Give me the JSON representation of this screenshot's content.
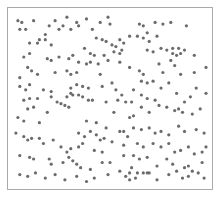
{
  "chart_data": {
    "type": "scatter",
    "title": "",
    "xlabel": "",
    "ylabel": "",
    "xlim": [
      0,
      1
    ],
    "ylim": [
      0,
      1
    ],
    "grid": false,
    "legend": null,
    "marker_color": "#6b6b6b",
    "frame_color": "#aaaaaa",
    "points": [
      [
        0.03,
        0.95
      ],
      [
        0.05,
        0.94
      ],
      [
        0.04,
        0.9
      ],
      [
        0.07,
        0.9
      ],
      [
        0.11,
        0.95
      ],
      [
        0.17,
        0.87
      ],
      [
        0.19,
        0.92
      ],
      [
        0.22,
        0.95
      ],
      [
        0.24,
        0.9
      ],
      [
        0.26,
        0.92
      ],
      [
        0.28,
        0.97
      ],
      [
        0.3,
        0.9
      ],
      [
        0.33,
        0.94
      ],
      [
        0.09,
        0.82
      ],
      [
        0.13,
        0.82
      ],
      [
        0.14,
        0.84
      ],
      [
        0.17,
        0.84
      ],
      [
        0.2,
        0.81
      ],
      [
        0.06,
        0.74
      ],
      [
        0.09,
        0.76
      ],
      [
        0.18,
        0.73
      ],
      [
        0.2,
        0.72
      ],
      [
        0.24,
        0.74
      ],
      [
        0.29,
        0.73
      ],
      [
        0.31,
        0.75
      ],
      [
        0.08,
        0.68
      ],
      [
        0.1,
        0.66
      ],
      [
        0.13,
        0.64
      ],
      [
        0.04,
        0.62
      ],
      [
        0.28,
        0.66
      ],
      [
        0.3,
        0.64
      ],
      [
        0.22,
        0.65
      ],
      [
        0.34,
        0.92
      ],
      [
        0.38,
        0.96
      ],
      [
        0.41,
        0.9
      ],
      [
        0.45,
        0.94
      ],
      [
        0.49,
        0.97
      ],
      [
        0.5,
        0.93
      ],
      [
        0.43,
        0.85
      ],
      [
        0.46,
        0.84
      ],
      [
        0.48,
        0.83
      ],
      [
        0.51,
        0.81
      ],
      [
        0.53,
        0.8
      ],
      [
        0.55,
        0.84
      ],
      [
        0.57,
        0.82
      ],
      [
        0.6,
        0.86
      ],
      [
        0.37,
        0.79
      ],
      [
        0.4,
        0.76
      ],
      [
        0.42,
        0.75
      ],
      [
        0.47,
        0.75
      ],
      [
        0.52,
        0.77
      ],
      [
        0.55,
        0.76
      ],
      [
        0.56,
        0.78
      ],
      [
        0.34,
        0.71
      ],
      [
        0.38,
        0.7
      ],
      [
        0.4,
        0.71
      ],
      [
        0.44,
        0.7
      ],
      [
        0.49,
        0.72
      ],
      [
        0.55,
        0.71
      ],
      [
        0.33,
        0.65
      ],
      [
        0.45,
        0.64
      ],
      [
        0.6,
        0.68
      ],
      [
        0.65,
        0.93
      ],
      [
        0.67,
        0.92
      ],
      [
        0.69,
        0.88
      ],
      [
        0.73,
        0.94
      ],
      [
        0.77,
        0.93
      ],
      [
        0.81,
        0.94
      ],
      [
        0.89,
        0.92
      ],
      [
        0.64,
        0.86
      ],
      [
        0.67,
        0.85
      ],
      [
        0.7,
        0.83
      ],
      [
        0.74,
        0.86
      ],
      [
        0.69,
        0.78
      ],
      [
        0.72,
        0.77
      ],
      [
        0.76,
        0.79
      ],
      [
        0.79,
        0.78
      ],
      [
        0.82,
        0.79
      ],
      [
        0.85,
        0.79
      ],
      [
        0.88,
        0.78
      ],
      [
        0.82,
        0.76
      ],
      [
        0.84,
        0.75
      ],
      [
        0.86,
        0.76
      ],
      [
        0.93,
        0.75
      ],
      [
        0.75,
        0.7
      ],
      [
        0.81,
        0.72
      ],
      [
        0.83,
        0.69
      ],
      [
        0.65,
        0.66
      ],
      [
        0.67,
        0.64
      ],
      [
        0.77,
        0.65
      ],
      [
        0.86,
        0.64
      ],
      [
        0.93,
        0.65
      ],
      [
        0.99,
        0.68
      ],
      [
        0.04,
        0.57
      ],
      [
        0.07,
        0.55
      ],
      [
        0.09,
        0.58
      ],
      [
        0.16,
        0.55
      ],
      [
        0.2,
        0.54
      ],
      [
        0.3,
        0.56
      ],
      [
        0.3,
        0.53
      ],
      [
        0.33,
        0.58
      ],
      [
        0.06,
        0.49
      ],
      [
        0.09,
        0.5
      ],
      [
        0.13,
        0.5
      ],
      [
        0.2,
        0.51
      ],
      [
        0.23,
        0.48
      ],
      [
        0.25,
        0.47
      ],
      [
        0.28,
        0.51
      ],
      [
        0.31,
        0.52
      ],
      [
        0.34,
        0.52
      ],
      [
        0.08,
        0.44
      ],
      [
        0.11,
        0.45
      ],
      [
        0.03,
        0.39
      ],
      [
        0.06,
        0.37
      ],
      [
        0.14,
        0.36
      ],
      [
        0.18,
        0.42
      ],
      [
        0.27,
        0.46
      ],
      [
        0.29,
        0.45
      ],
      [
        0.36,
        0.57
      ],
      [
        0.39,
        0.56
      ],
      [
        0.46,
        0.57
      ],
      [
        0.51,
        0.59
      ],
      [
        0.53,
        0.55
      ],
      [
        0.56,
        0.52
      ],
      [
        0.62,
        0.55
      ],
      [
        0.66,
        0.52
      ],
      [
        0.36,
        0.51
      ],
      [
        0.39,
        0.49
      ],
      [
        0.41,
        0.49
      ],
      [
        0.48,
        0.48
      ],
      [
        0.54,
        0.49
      ],
      [
        0.58,
        0.48
      ],
      [
        0.61,
        0.48
      ],
      [
        0.52,
        0.42
      ],
      [
        0.6,
        0.39
      ],
      [
        0.62,
        0.4
      ],
      [
        0.48,
        0.33
      ],
      [
        0.38,
        0.37
      ],
      [
        0.43,
        0.36
      ],
      [
        0.66,
        0.6
      ],
      [
        0.69,
        0.59
      ],
      [
        0.72,
        0.6
      ],
      [
        0.76,
        0.56
      ],
      [
        0.8,
        0.59
      ],
      [
        0.84,
        0.53
      ],
      [
        0.88,
        0.48
      ],
      [
        0.91,
        0.51
      ],
      [
        0.94,
        0.56
      ],
      [
        0.69,
        0.5
      ],
      [
        0.73,
        0.49
      ],
      [
        0.75,
        0.46
      ],
      [
        0.66,
        0.45
      ],
      [
        0.7,
        0.42
      ],
      [
        0.79,
        0.45
      ],
      [
        0.83,
        0.43
      ],
      [
        0.85,
        0.44
      ],
      [
        0.87,
        0.42
      ],
      [
        0.92,
        0.41
      ],
      [
        0.96,
        0.44
      ],
      [
        0.99,
        0.53
      ],
      [
        0.02,
        0.3
      ],
      [
        0.06,
        0.28
      ],
      [
        0.08,
        0.26
      ],
      [
        0.1,
        0.27
      ],
      [
        0.14,
        0.27
      ],
      [
        0.16,
        0.24
      ],
      [
        0.21,
        0.26
      ],
      [
        0.25,
        0.22
      ],
      [
        0.28,
        0.19
      ],
      [
        0.3,
        0.21
      ],
      [
        0.04,
        0.17
      ],
      [
        0.09,
        0.16
      ],
      [
        0.11,
        0.15
      ],
      [
        0.19,
        0.15
      ],
      [
        0.2,
        0.12
      ],
      [
        0.26,
        0.13
      ],
      [
        0.29,
        0.16
      ],
      [
        0.31,
        0.14
      ],
      [
        0.33,
        0.12
      ],
      [
        0.34,
        0.3
      ],
      [
        0.37,
        0.28
      ],
      [
        0.4,
        0.31
      ],
      [
        0.43,
        0.29
      ],
      [
        0.45,
        0.26
      ],
      [
        0.47,
        0.27
      ],
      [
        0.34,
        0.22
      ],
      [
        0.36,
        0.24
      ],
      [
        0.42,
        0.2
      ],
      [
        0.46,
        0.19
      ],
      [
        0.35,
        0.1
      ],
      [
        0.4,
        0.09
      ],
      [
        0.46,
        0.13
      ],
      [
        0.5,
        0.13
      ],
      [
        0.55,
        0.31
      ],
      [
        0.57,
        0.31
      ],
      [
        0.59,
        0.28
      ],
      [
        0.62,
        0.33
      ],
      [
        0.66,
        0.32
      ],
      [
        0.51,
        0.25
      ],
      [
        0.57,
        0.23
      ],
      [
        0.64,
        0.24
      ],
      [
        0.67,
        0.22
      ],
      [
        0.57,
        0.17
      ],
      [
        0.62,
        0.17
      ],
      [
        0.65,
        0.15
      ],
      [
        0.61,
        0.1
      ],
      [
        0.7,
        0.33
      ],
      [
        0.73,
        0.3
      ],
      [
        0.76,
        0.31
      ],
      [
        0.8,
        0.29
      ],
      [
        0.85,
        0.34
      ],
      [
        0.88,
        0.31
      ],
      [
        0.94,
        0.32
      ],
      [
        0.98,
        0.3
      ],
      [
        0.72,
        0.24
      ],
      [
        0.76,
        0.22
      ],
      [
        0.8,
        0.24
      ],
      [
        0.83,
        0.19
      ],
      [
        0.86,
        0.2
      ],
      [
        0.9,
        0.22
      ],
      [
        0.69,
        0.16
      ],
      [
        0.74,
        0.11
      ],
      [
        0.79,
        0.15
      ],
      [
        0.82,
        0.12
      ],
      [
        0.88,
        0.1
      ],
      [
        0.93,
        0.18
      ],
      [
        0.97,
        0.19
      ],
      [
        0.04,
        0.06
      ],
      [
        0.08,
        0.05
      ],
      [
        0.12,
        0.07
      ],
      [
        0.17,
        0.04
      ],
      [
        0.22,
        0.06
      ],
      [
        0.27,
        0.03
      ],
      [
        0.33,
        0.05
      ],
      [
        0.38,
        0.02
      ],
      [
        0.42,
        0.04
      ],
      [
        0.49,
        0.06
      ],
      [
        0.55,
        0.08
      ],
      [
        0.58,
        0.05
      ],
      [
        0.63,
        0.04
      ],
      [
        0.7,
        0.07
      ],
      [
        0.74,
        0.03
      ],
      [
        0.8,
        0.06
      ],
      [
        0.84,
        0.08
      ],
      [
        0.87,
        0.04
      ],
      [
        0.9,
        0.05
      ],
      [
        0.95,
        0.07
      ],
      [
        0.98,
        0.04
      ],
      [
        0.6,
        0.07
      ],
      [
        0.6,
        0.03
      ],
      [
        0.64,
        0.07
      ],
      [
        0.67,
        0.07
      ],
      [
        0.69,
        0.07
      ],
      [
        0.9,
        0.11
      ],
      [
        0.92,
        0.08
      ],
      [
        0.97,
        0.13
      ],
      [
        0.99,
        0.22
      ]
    ]
  }
}
